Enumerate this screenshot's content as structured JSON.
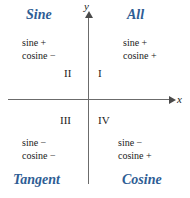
{
  "figure": {
    "background_color": "#ffffff",
    "heading_color": "#2e5d94",
    "axis_color": "#6b6b6b",
    "text_color": "#1a1a1a"
  },
  "axes": {
    "x_label": "x",
    "y_label": "y",
    "x_arrow": "arrow-right",
    "y_arrow": "arrow-up"
  },
  "quadrants": [
    {
      "numeral": "I",
      "heading": "All",
      "sine": "sine +",
      "cosine": "cosine +",
      "position": "top-right"
    },
    {
      "numeral": "II",
      "heading": "Sine",
      "sine": "sine +",
      "cosine": "cosine −",
      "position": "top-left"
    },
    {
      "numeral": "III",
      "heading": "Tangent",
      "sine": "sine −",
      "cosine": "cosine −",
      "position": "bottom-left"
    },
    {
      "numeral": "IV",
      "heading": "Cosine",
      "sine": "sine −",
      "cosine": "cosine +",
      "position": "bottom-right"
    }
  ],
  "chart_data": {
    "type": "table",
    "xlabel": "x",
    "ylabel": "y",
    "grid": false,
    "legend": "none",
    "columns": [
      "quadrant",
      "heading",
      "sine",
      "cosine"
    ],
    "rows": [
      [
        "I",
        "All",
        "+",
        "+"
      ],
      [
        "II",
        "Sine",
        "+",
        "−"
      ],
      [
        "III",
        "Tangent",
        "−",
        "−"
      ],
      [
        "IV",
        "Cosine",
        "−",
        "+"
      ]
    ]
  }
}
